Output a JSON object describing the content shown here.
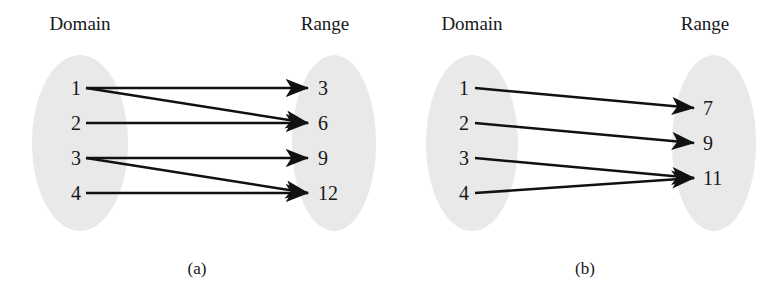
{
  "figure": {
    "type": "mapping-diagram-pair",
    "background_color": "#ffffff",
    "ellipse_fill": "#e9e9e9",
    "arrow_color": "#111111",
    "text_color": "#17171a"
  },
  "panels": [
    {
      "id": "a",
      "caption": "(a)",
      "domain_heading": "Domain",
      "range_heading": "Range",
      "domain_items": [
        "1",
        "2",
        "3",
        "4"
      ],
      "range_items": [
        "3",
        "6",
        "9",
        "12"
      ],
      "mappings": [
        {
          "from": "1",
          "to": "3"
        },
        {
          "from": "1",
          "to": "6"
        },
        {
          "from": "2",
          "to": "6"
        },
        {
          "from": "3",
          "to": "9"
        },
        {
          "from": "3",
          "to": "12"
        },
        {
          "from": "4",
          "to": "12"
        }
      ]
    },
    {
      "id": "b",
      "caption": "(b)",
      "domain_heading": "Domain",
      "range_heading": "Range",
      "domain_items": [
        "1",
        "2",
        "3",
        "4"
      ],
      "range_items": [
        "7",
        "9",
        "11"
      ],
      "mappings": [
        {
          "from": "1",
          "to": "7"
        },
        {
          "from": "2",
          "to": "9"
        },
        {
          "from": "3",
          "to": "11"
        },
        {
          "from": "4",
          "to": "11"
        }
      ]
    }
  ],
  "geometry": {
    "panel_a": {
      "domain_ellipse": {
        "cx": 80,
        "cy": 143,
        "rx": 48,
        "ry": 88
      },
      "range_ellipse": {
        "cx": 334,
        "cy": 143,
        "rx": 42,
        "ry": 88
      },
      "domain_heading_pos": {
        "x": 80,
        "y": 30
      },
      "range_heading_pos": {
        "x": 325,
        "y": 30
      },
      "caption_pos": {
        "x": 197,
        "y": 274
      },
      "domain_label_x": 76,
      "range_label_x": 318,
      "edge_start_x": 86,
      "edge_end_x": 308,
      "row_y": [
        88,
        123,
        158,
        193
      ]
    },
    "panel_b": {
      "domain_ellipse": {
        "cx": 472,
        "cy": 143,
        "rx": 46,
        "ry": 88
      },
      "range_ellipse": {
        "cx": 714,
        "cy": 143,
        "rx": 42,
        "ry": 88
      },
      "domain_heading_pos": {
        "x": 472,
        "y": 30
      },
      "range_heading_pos": {
        "x": 705,
        "y": 30
      },
      "caption_pos": {
        "x": 585,
        "y": 274
      },
      "domain_label_x": 464,
      "range_label_x": 703,
      "edge_start_x": 475,
      "edge_end_x": 694,
      "domain_row_y": [
        88,
        123,
        158,
        193
      ],
      "range_row_y": [
        108,
        143,
        178
      ]
    }
  }
}
